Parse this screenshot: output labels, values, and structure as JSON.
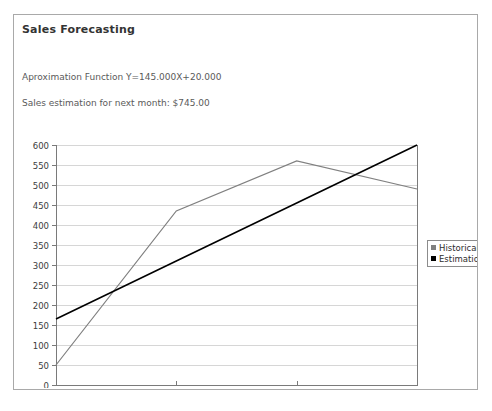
{
  "report": {
    "title": "Sales Forecasting",
    "approximation_line": "Aproximation Function Y=145.000X+20.000",
    "estimation_line": "Sales estimation for next month: $745.00"
  },
  "legend": {
    "position": "right",
    "items": [
      {
        "label": "Historical",
        "color": "#808080",
        "marker": "square"
      },
      {
        "label": "Estimation",
        "color": "#000000",
        "marker": "square"
      }
    ]
  },
  "colors": {
    "historical": "#808080",
    "estimation": "#000000",
    "axis": "#7a7a7a",
    "grid": "#d6d6d6",
    "panel_border": "#a9a9a9",
    "title_text": "#333333",
    "body_text": "#5a5a5a"
  },
  "chart_data": {
    "type": "line",
    "title": "",
    "xlabel": "",
    "ylabel": "",
    "grid": true,
    "legend_position": "right",
    "categories": [
      "March-2003",
      "April-2003",
      "May-2003",
      "June-2003"
    ],
    "x_tick_labels": [
      "March-2003",
      "April-2003",
      "May-2003",
      "June-2003"
    ],
    "y_tick_labels": [
      "0",
      "50",
      "100",
      "150",
      "200",
      "250",
      "300",
      "350",
      "400",
      "450",
      "500",
      "550",
      "600"
    ],
    "y_ticks": [
      0,
      50,
      100,
      150,
      200,
      250,
      300,
      350,
      400,
      450,
      500,
      550,
      600
    ],
    "ylim": [
      0,
      600
    ],
    "series": [
      {
        "name": "Historical",
        "color": "#808080",
        "values": [
          50,
          435,
          560,
          490
        ]
      },
      {
        "name": "Estimation",
        "color": "#000000",
        "values": [
          165,
          310,
          455,
          600
        ]
      }
    ]
  }
}
